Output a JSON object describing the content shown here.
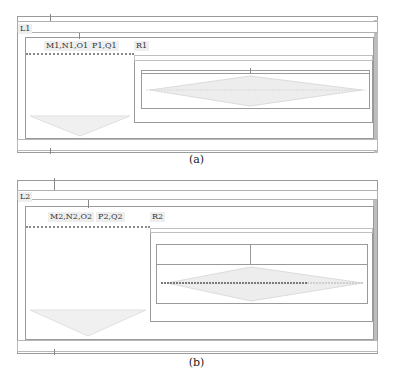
{
  "figure_a": {
    "caption": "(a)",
    "loop_label": "L1",
    "group1_label": "M1,N1,O1",
    "group2_label": "P1,Q1",
    "region_label": "R1"
  },
  "figure_b": {
    "caption": "(b)",
    "loop_label": "L2",
    "group1_label": "M2,N2,O2",
    "group2_label": "P2,Q2",
    "region_label": "R2"
  },
  "colors": {
    "border": "#9a9a9a",
    "shade": "#bdbdbd",
    "label_bg": "#eeeeee",
    "diamond": "#e2e2e2"
  }
}
